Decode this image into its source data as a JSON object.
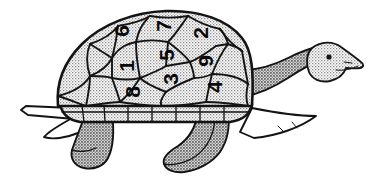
{
  "image": {
    "title": "Numbered Turtle",
    "subject": "turtle",
    "style": "black and white line drawing with stippled shading",
    "orientation": "side profile facing right",
    "background_color": "#ffffff",
    "ink_color": "#141414",
    "shading_color": "#9a9a9a"
  },
  "shell": {
    "label": "turtle shell",
    "scute_count": 9,
    "digit_rotation_degrees": -90,
    "scutes": [
      {
        "id": "scute-6",
        "value": "6",
        "x": 121,
        "y": 31,
        "rotation": -90
      },
      {
        "id": "scute-7",
        "value": "7",
        "x": 163,
        "y": 26,
        "rotation": -90
      },
      {
        "id": "scute-2",
        "value": "2",
        "x": 200,
        "y": 33,
        "rotation": -90
      },
      {
        "id": "scute-5",
        "value": "5",
        "x": 166,
        "y": 55,
        "rotation": -90
      },
      {
        "id": "scute-9",
        "value": "9",
        "x": 205,
        "y": 61,
        "rotation": -90
      },
      {
        "id": "scute-1",
        "value": "1",
        "x": 126,
        "y": 66,
        "rotation": -90
      },
      {
        "id": "scute-3",
        "value": "3",
        "x": 170,
        "y": 79,
        "rotation": -90
      },
      {
        "id": "scute-8",
        "value": "8",
        "x": 132,
        "y": 92,
        "rotation": -90
      },
      {
        "id": "scute-4",
        "value": "4",
        "x": 214,
        "y": 87,
        "rotation": -90
      }
    ],
    "digits_in_reading_order": [
      "6",
      "7",
      "2",
      "5",
      "9",
      "1",
      "3",
      "8",
      "4"
    ]
  },
  "anatomy": {
    "head": {
      "label": "head",
      "facing": "right"
    },
    "eye": {
      "label": "eye",
      "shape": "filled dot"
    },
    "mouth": {
      "label": "mouth",
      "shape": "curved line"
    },
    "neck": {
      "label": "neck"
    },
    "tail": {
      "label": "tail",
      "position": "left"
    },
    "front_leg": {
      "label": "front leg"
    },
    "rear_leg": {
      "label": "rear leg"
    },
    "front_flipper": {
      "label": "front flipper"
    },
    "rear_flipper": {
      "label": "rear flipper"
    },
    "plastron_rim": {
      "label": "shell rim marginal scutes"
    }
  }
}
